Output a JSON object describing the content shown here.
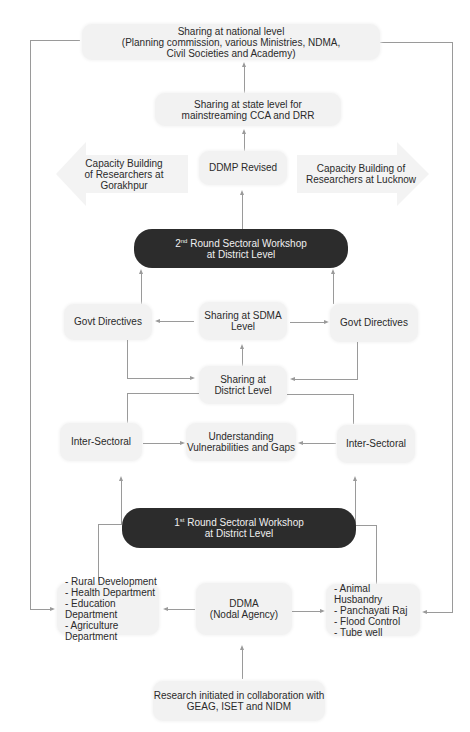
{
  "nodes": {
    "national": {
      "line1": "Sharing at national level",
      "line2": "(Planning commission, various Ministries, NDMA,",
      "line3": "Civil Societies and Academy)"
    },
    "state": {
      "line1": "Sharing at state level for",
      "line2": "mainstreaming CCA and DRR"
    },
    "capacity_gorakhpur": {
      "line1": "Capacity Building",
      "line2": "of Researchers at Gorakhpur"
    },
    "ddmp": {
      "label": "DDMP Revised"
    },
    "capacity_lucknow": {
      "line1": "Capacity Building of",
      "line2": "Researchers at Lucknow"
    },
    "workshop2": {
      "ordinal": "2",
      "suffix": "nd",
      "line1_rest": " Round Sectoral Workshop",
      "line2": "at District Level"
    },
    "govt_left": {
      "label": "Govt Directives"
    },
    "sdma": {
      "line1": "Sharing at SDMA",
      "line2": "Level"
    },
    "govt_right": {
      "label": "Govt Directives"
    },
    "district_sharing": {
      "line1": "Sharing at",
      "line2": "District Level"
    },
    "inter_left": {
      "label": "Inter-Sectoral"
    },
    "vulnerabilities": {
      "line1": "Understanding",
      "line2": "Vulnerabilities and Gaps"
    },
    "inter_right": {
      "label": "Inter-Sectoral"
    },
    "workshop1": {
      "ordinal": "1",
      "suffix": "st",
      "line1_rest": " Round Sectoral Workshop",
      "line2": "at District Level"
    },
    "departments_left": {
      "items": [
        "- Rural Development",
        "- Health Department",
        "- Education Department",
        "- Agriculture Department"
      ]
    },
    "ddma": {
      "line1": "DDMA",
      "line2": "(Nodal Agency)"
    },
    "departments_right": {
      "items": [
        "- Animal Husbandry",
        "- Panchayati Raj",
        "- Flood Control",
        "- Tube well"
      ]
    },
    "research": {
      "line1": "Research initiated in collaboration with",
      "line2": "GEAG, ISET and NIDM"
    }
  },
  "colors": {
    "box_fill": "#f2f2f2",
    "dark_fill": "#2c2c2c",
    "connector": "#9a9a9a",
    "big_arrow_fill": "#f3f3f3"
  }
}
